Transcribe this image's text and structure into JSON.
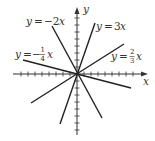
{
  "diagram": {
    "type": "coordinate-plane-lines-through-origin",
    "axes": {
      "x_label": "x",
      "y_label": "y"
    },
    "lines": [
      {
        "equation": "y = -2x",
        "lhs": "y",
        "eq": "=",
        "coef": "−2",
        "var": "x",
        "slope": -2
      },
      {
        "equation": "y = 3x",
        "lhs": "y",
        "eq": "=",
        "coef": "3",
        "var": "x",
        "slope": 3
      },
      {
        "equation": "y = -1/4 x",
        "lhs": "y",
        "eq": "=",
        "sign": "−",
        "num": "1",
        "den": "4",
        "var": "x",
        "slope": -0.25
      },
      {
        "equation": "y = 2/3 x",
        "lhs": "y",
        "eq": "=",
        "num": "2",
        "den": "3",
        "var": "x",
        "slope": 0.6667
      }
    ],
    "colors": {
      "line": "#222222",
      "text": "#333333",
      "background": "#ffffff"
    }
  }
}
